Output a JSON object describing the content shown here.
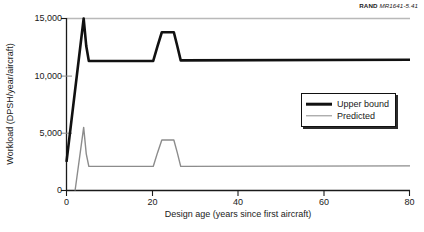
{
  "credit": {
    "organization": "RAND",
    "document_id": "MR1641-5.41"
  },
  "legend": {
    "position": "upper-right-inside",
    "entries": [
      {
        "label": "Upper bound",
        "color": "#111111",
        "icon": "line-swatch-icon"
      },
      {
        "label": "Predicted",
        "color": "#8c8c8c",
        "icon": "line-swatch-icon"
      }
    ]
  },
  "axes": {
    "y_title": "Workload (DPSH/year/aircraft)",
    "x_title": "Design age (years since first aircraft)",
    "y_ticks": [
      "0",
      "5,000",
      "10,000",
      "15,000"
    ],
    "x_ticks": [
      "0",
      "20",
      "40",
      "60",
      "80"
    ]
  },
  "chart_data": {
    "type": "line",
    "title": "",
    "subtitle": "",
    "xlabel": "Design age (years since first aircraft)",
    "ylabel": "Workload (DPSH/year/aircraft)",
    "xlim": [
      0,
      80
    ],
    "ylim": [
      0,
      15000
    ],
    "xticks": [
      0,
      20,
      40,
      60,
      80
    ],
    "yticks": [
      0,
      5000,
      10000,
      15000
    ],
    "grid": false,
    "legend_position": "upper right",
    "annotations": [
      "RAND MR1641-5.41"
    ],
    "series": [
      {
        "name": "Upper bound",
        "color": "#111111",
        "linewidth": 2.6,
        "x": [
          0,
          4,
          4.6,
          5.2,
          20.2,
          21.2,
          22.2,
          25.0,
          25.8,
          26.6,
          80
        ],
        "y": [
          2500,
          15000,
          12600,
          11300,
          11300,
          12600,
          13800,
          13800,
          12600,
          11350,
          11400
        ]
      },
      {
        "name": "Predicted",
        "color": "#8c8c8c",
        "linewidth": 1.4,
        "x": [
          2.0,
          4.0,
          4.6,
          5.2,
          20.2,
          21.2,
          22.2,
          25.0,
          25.8,
          26.6,
          80
        ],
        "y": [
          0,
          5500,
          3200,
          2100,
          2100,
          3300,
          4400,
          4400,
          3300,
          2100,
          2150
        ]
      }
    ]
  }
}
